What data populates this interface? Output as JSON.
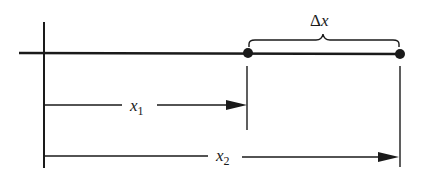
{
  "diagram": {
    "labels": {
      "delta_symbol": "Δ",
      "delta_var": "x",
      "x1_var": "x",
      "x1_sub": "1",
      "x2_var": "x",
      "x2_sub": "2"
    },
    "colors": {
      "line": "#1a1a1a",
      "background": "#ffffff"
    },
    "points": [
      {
        "name": "position-1",
        "x": 248,
        "y": 53
      },
      {
        "name": "position-2",
        "x": 400,
        "y": 54
      }
    ]
  }
}
